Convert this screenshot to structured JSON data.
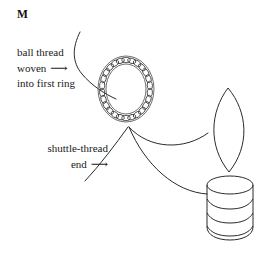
{
  "figure": {
    "label": "M",
    "type": "tatting-instruction-diagram",
    "background_color": "#ffffff",
    "ink_color": "#2a2a2a"
  },
  "annotations": {
    "ball_thread": {
      "line1": "ball thread",
      "line2": "woven",
      "line3": "into first ring",
      "arrow": "⟶"
    },
    "shuttle_thread": {
      "line1": "shuttle-thread",
      "line2": "end",
      "arrow": "⟶"
    }
  },
  "parts": {
    "ring_name": "tatted-ring",
    "ring_stitch_count": 26,
    "leaf_name": "second-ring-leaf",
    "shuttle_name": "shuttle-spool",
    "shuttle_band_count": 4
  }
}
